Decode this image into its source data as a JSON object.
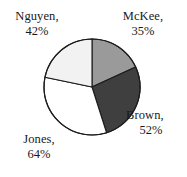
{
  "chart_data": {
    "type": "pie",
    "title": "",
    "xlabel": "",
    "ylabel": "",
    "legend_position": "outside-labels",
    "grid": false,
    "categories": [
      "McKee",
      "Brown",
      "Jones",
      "Nguyen"
    ],
    "values": [
      35,
      52,
      64,
      42
    ],
    "value_unit": "%",
    "value_total": 193,
    "slices": [
      {
        "name": "McKee",
        "value": 35,
        "value_text": "35%",
        "label_name": "McKee,",
        "label_value": "35%",
        "color": "#9a9a9a",
        "start_angle_deg": 0,
        "end_angle_deg": 65.3,
        "label_position": "top-right"
      },
      {
        "name": "Brown",
        "value": 52,
        "value_text": "52%",
        "label_name": "Brown,",
        "label_value": "52%",
        "color": "#3f3f3f",
        "start_angle_deg": 65.3,
        "end_angle_deg": 162.3,
        "label_position": "right"
      },
      {
        "name": "Jones",
        "value": 64,
        "value_text": "64%",
        "label_name": "Jones,",
        "label_value": "64%",
        "color": "#ffffff",
        "start_angle_deg": 162.3,
        "end_angle_deg": 281.7,
        "label_position": "bottom-left"
      },
      {
        "name": "Nguyen",
        "value": 42,
        "value_text": "42%",
        "label_name": "Nguyen,",
        "label_value": "42%",
        "color": "#f2f2f2",
        "start_angle_deg": 281.7,
        "end_angle_deg": 360,
        "label_position": "top-left"
      }
    ],
    "geometry": {
      "center_x": 92,
      "center_y": 87,
      "radius": 48
    },
    "colors": {
      "outline": "#1c1c1c",
      "background": "#ffffff",
      "text": "#1a1a1a"
    }
  }
}
